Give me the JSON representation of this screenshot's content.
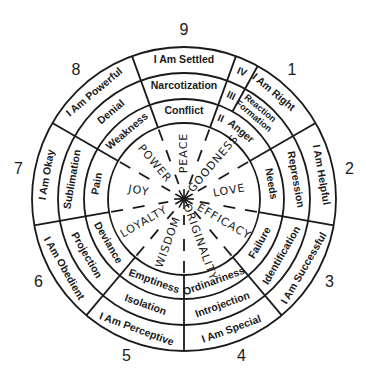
{
  "diagram": {
    "type": "enneagram-wheel",
    "center": {
      "x": 184,
      "y": 199
    },
    "radii": {
      "outer": 152,
      "ring3": 126,
      "ring2": 100,
      "inner": 76
    },
    "numbers": [
      {
        "label": "9",
        "angle": 0
      },
      {
        "label": "1",
        "angle": 40
      },
      {
        "label": "2",
        "angle": 80
      },
      {
        "label": "3",
        "angle": 120
      },
      {
        "label": "4",
        "angle": 160
      },
      {
        "label": "5",
        "angle": 200
      },
      {
        "label": "6",
        "angle": 240
      },
      {
        "label": "7",
        "angle": 280
      },
      {
        "label": "8",
        "angle": 320
      }
    ],
    "self_image_ring": [
      "I Am Settled",
      "I Am Right",
      "I Am Helpful",
      "I Am Successful",
      "I Am Special",
      "I Am Perceptive",
      "I Am Obedient",
      "I Am Okay",
      "I Am Powerful"
    ],
    "defense_ring": [
      "Narcotization",
      "Reaction Formation",
      "Repression",
      "Identification",
      "Introjection",
      "Isolation",
      "Projection",
      "Sublimation",
      "Denial"
    ],
    "avoidance_ring": [
      "Conflict",
      "Anger",
      "Needs",
      "Failure",
      "Ordinariness",
      "Emptiness",
      "Deviance",
      "Pain",
      "Weakness"
    ],
    "virtues": [
      "PEACE",
      "GOODNESS",
      "LOVE",
      "EFFICACY",
      "ORIGINALITY",
      "WISDOM",
      "LOYALTY",
      "JOY",
      "POWER"
    ],
    "ring_markers": [
      "IV",
      "III",
      "II"
    ],
    "center_symbol": "asterisk-star"
  }
}
